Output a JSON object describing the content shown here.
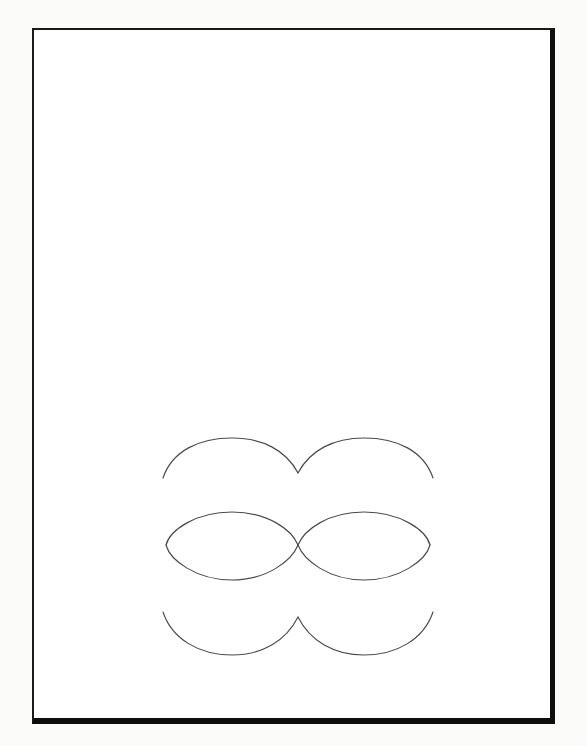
{
  "document": {
    "kind": "scanned-page",
    "page_background_color": "#ffffff",
    "scan_background_color": "#fbfbfa",
    "frame_color": "#1a1a1a",
    "frame": {
      "left": 32,
      "top": 28,
      "width": 523,
      "height": 696,
      "border_top_px": 2,
      "border_left_px": 2,
      "border_right_px": 5,
      "border_bottom_px": 6
    }
  },
  "figure": {
    "title": "",
    "caption": "",
    "stroke_color": "#4a4a4a",
    "stroke_width": 1.15,
    "geometry": {
      "circle_radius": 66,
      "left_circle_center": {
        "x": 232,
        "y": 545
      },
      "right_circle_center": {
        "x": 364,
        "y": 545
      },
      "tangency_point": {
        "x": 298,
        "y": 545
      },
      "upper_cusp": {
        "x": 298,
        "y": 473
      },
      "lower_cusp": {
        "x": 298,
        "y": 617
      },
      "left_lens_vertex": {
        "x": 166,
        "y": 545
      },
      "right_lens_vertex": {
        "x": 430,
        "y": 545
      },
      "upper_arc_apex_y": 438,
      "lens_top_y": 512,
      "lens_bottom_y": 580,
      "lower_arc_base_y": 655,
      "upper_arc_left_end": {
        "x": 163,
        "y": 478
      },
      "upper_arc_right_end": {
        "x": 433,
        "y": 478
      },
      "lower_arc_left_end": {
        "x": 163,
        "y": 612
      },
      "lower_arc_right_end": {
        "x": 433,
        "y": 612
      }
    },
    "curves": [
      {
        "name": "upper-left-arc",
        "path": "M 163 478 C 172 451 199 438 232 438 C 262 438 286 450 298 473"
      },
      {
        "name": "upper-right-arc",
        "path": "M 298 473 C 310 450 334 438 364 438 C 397 438 424 451 433 478"
      },
      {
        "name": "left-lens-upper-arc",
        "path": "M 166 545 C 170 530 196 512 232 512 C 268 512 292 530 298 545"
      },
      {
        "name": "left-lens-lower-arc",
        "path": "M 166 545 C 170 560 196 580 232 580 C 268 580 292 560 298 545"
      },
      {
        "name": "right-lens-upper-arc",
        "path": "M 298 545 C 304 530 328 512 364 512 C 400 512 426 530 430 545"
      },
      {
        "name": "right-lens-lower-arc",
        "path": "M 298 545 C 304 560 328 580 364 580 C 400 580 426 560 430 545"
      },
      {
        "name": "lower-left-arc",
        "path": "M 163 612 C 172 639 199 655 232 655 C 262 655 286 641 298 617"
      },
      {
        "name": "lower-right-arc",
        "path": "M 298 617 C 310 641 334 655 364 655 C 397 655 424 639 433 612"
      }
    ]
  }
}
